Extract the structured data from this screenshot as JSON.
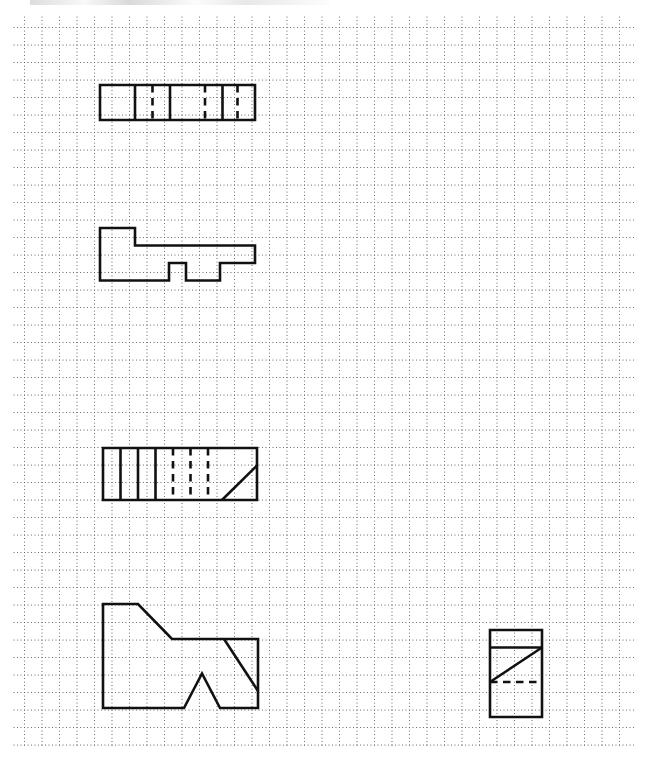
{
  "page": {
    "width": 657,
    "height": 776,
    "background_color": "#ffffff",
    "ink_color": "#111111",
    "dot_color": "#5a5a5a",
    "media": "dot-grid-paper",
    "scan_artifact_label": "scan-edge-smudge"
  },
  "grid": {
    "label": "dotted-grid",
    "origin_x": 24.5,
    "origin_y": 27.5,
    "minor_spacing": 3.5,
    "major_spacing": 17.5,
    "columns": 35,
    "rows": 41,
    "dot_radius": 0.62,
    "dot_color": "#5a5a5a",
    "right_edge": 636.0,
    "bottom_edge": 745.0
  },
  "figures": [
    {
      "id": "figure-1",
      "name": "segmented-rectangle-top",
      "kind": "polygon-with-internal-lines",
      "stroke_width": 2.6,
      "outline": [
        [
          100.0,
          85.0
        ],
        [
          255.0,
          85.0
        ],
        [
          255.0,
          120.0
        ],
        [
          100.0,
          120.0
        ]
      ],
      "internal_lines": [
        {
          "name": "divider-1-solid",
          "style": "solid",
          "from": [
            135.0,
            85.0
          ],
          "to": [
            135.0,
            120.0
          ]
        },
        {
          "name": "divider-2-dashed",
          "style": "dashed",
          "from": [
            152.5,
            85.0
          ],
          "to": [
            152.5,
            120.0
          ]
        },
        {
          "name": "divider-3-solid",
          "style": "solid",
          "from": [
            170.0,
            85.0
          ],
          "to": [
            170.0,
            120.0
          ]
        },
        {
          "name": "divider-4-dashed",
          "style": "dashed",
          "from": [
            205.0,
            85.0
          ],
          "to": [
            205.0,
            120.0
          ]
        },
        {
          "name": "divider-5-solid",
          "style": "solid",
          "from": [
            222.5,
            85.0
          ],
          "to": [
            222.5,
            120.0
          ]
        },
        {
          "name": "divider-6-dashed",
          "style": "dashed",
          "from": [
            237.5,
            85.0
          ],
          "to": [
            237.5,
            120.0
          ]
        }
      ]
    },
    {
      "id": "figure-2",
      "name": "stepped-key-polygon",
      "kind": "closed-polygon",
      "stroke_width": 2.6,
      "outline": [
        [
          100.0,
          228.0
        ],
        [
          135.0,
          228.0
        ],
        [
          135.0,
          245.5
        ],
        [
          255.0,
          245.5
        ],
        [
          255.0,
          263.0
        ],
        [
          220.0,
          263.0
        ],
        [
          220.0,
          280.5
        ],
        [
          186.0,
          280.5
        ],
        [
          186.0,
          263.0
        ],
        [
          169.0,
          263.0
        ],
        [
          169.0,
          280.5
        ],
        [
          100.0,
          280.5
        ]
      ],
      "internal_lines": []
    },
    {
      "id": "figure-3",
      "name": "segmented-rectangle-with-diagonal",
      "kind": "polygon-with-internal-lines",
      "stroke_width": 2.6,
      "outline": [
        [
          103.0,
          448.0
        ],
        [
          257.0,
          448.0
        ],
        [
          257.0,
          500.0
        ],
        [
          103.0,
          500.0
        ]
      ],
      "internal_lines": [
        {
          "name": "divider-1-solid",
          "style": "solid",
          "from": [
            120.5,
            448.0
          ],
          "to": [
            120.5,
            500.0
          ]
        },
        {
          "name": "divider-2-solid",
          "style": "solid",
          "from": [
            138.0,
            448.0
          ],
          "to": [
            138.0,
            500.0
          ]
        },
        {
          "name": "divider-3-solid",
          "style": "solid",
          "from": [
            155.5,
            448.0
          ],
          "to": [
            155.5,
            500.0
          ]
        },
        {
          "name": "divider-4-dashed",
          "style": "dashed",
          "from": [
            173.0,
            448.0
          ],
          "to": [
            173.0,
            500.0
          ]
        },
        {
          "name": "divider-5-dashed",
          "style": "dashed",
          "from": [
            190.5,
            448.0
          ],
          "to": [
            190.5,
            500.0
          ]
        },
        {
          "name": "divider-6-dashed",
          "style": "dashed",
          "from": [
            208.0,
            448.0
          ],
          "to": [
            208.0,
            500.0
          ]
        },
        {
          "name": "diagonal-solid",
          "style": "solid",
          "from": [
            222.0,
            500.0
          ],
          "to": [
            257.0,
            465.5
          ]
        }
      ]
    },
    {
      "id": "figure-4",
      "name": "arrow-notch-polygon",
      "kind": "closed-polygon",
      "stroke_width": 2.6,
      "outline": [
        [
          103.0,
          604.0
        ],
        [
          138.0,
          604.0
        ],
        [
          172.0,
          639.0
        ],
        [
          258.0,
          639.0
        ],
        [
          258.0,
          708.0
        ],
        [
          220.0,
          708.0
        ],
        [
          202.0,
          673.5
        ],
        [
          184.0,
          708.0
        ],
        [
          103.0,
          708.0
        ]
      ],
      "internal_lines": [
        {
          "name": "diagonal-solid",
          "style": "solid",
          "from": [
            224.0,
            639.0
          ],
          "to": [
            258.0,
            691.0
          ]
        }
      ]
    },
    {
      "id": "figure-5",
      "name": "small-rectangle-with-diagonal",
      "kind": "polygon-with-internal-lines",
      "stroke_width": 2.6,
      "outline": [
        [
          490.0,
          630.0
        ],
        [
          542.0,
          630.0
        ],
        [
          542.0,
          717.0
        ],
        [
          490.0,
          717.0
        ]
      ],
      "internal_lines": [
        {
          "name": "top-divider-solid",
          "style": "solid",
          "from": [
            490.0,
            647.5
          ],
          "to": [
            542.0,
            647.5
          ]
        },
        {
          "name": "diagonal-solid",
          "style": "solid",
          "from": [
            490.0,
            682.0
          ],
          "to": [
            542.0,
            647.5
          ]
        },
        {
          "name": "bottom-divider-dashed",
          "style": "dashed",
          "from": [
            490.0,
            682.0
          ],
          "to": [
            542.0,
            682.0
          ]
        }
      ]
    }
  ]
}
